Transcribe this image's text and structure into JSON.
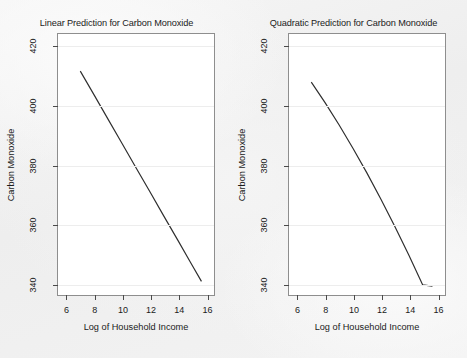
{
  "figure": {
    "background_color": "#f2f2f2",
    "plot_background_color": "#ffffff",
    "line_color": "#2e2e2e",
    "grid_color": "#ededed"
  },
  "chart_data": [
    {
      "type": "line",
      "panel": "left",
      "title": "Linear Prediction for Carbon Monoxide",
      "xlabel": "Log of Household Income",
      "ylabel": "Carbon Monoxide",
      "xlim": [
        5.4,
        16.6
      ],
      "ylim": [
        336,
        424
      ],
      "xticks": [
        6,
        8,
        10,
        12,
        14,
        16
      ],
      "yticks": [
        340,
        360,
        380,
        400,
        420
      ],
      "xtick_labels": [
        "6",
        "8",
        "10",
        "12",
        "14",
        "16"
      ],
      "ytick_labels": [
        "340",
        "360",
        "380",
        "400",
        "420"
      ],
      "grid": true,
      "legend": null,
      "series": [
        {
          "name": "Linear prediction",
          "x": [
            7.0,
            8.0,
            9.0,
            10.0,
            11.0,
            12.0,
            13.0,
            14.0,
            15.0,
            15.7
          ],
          "y": [
            411.5,
            403.4,
            395.2,
            387.1,
            378.9,
            370.8,
            362.6,
            354.5,
            346.3,
            340.6
          ]
        }
      ]
    },
    {
      "type": "line",
      "panel": "right",
      "title": "Quadratic Prediction for Carbon Monoxide",
      "xlabel": "Log of Household Income",
      "ylabel": "Carbon Monoxide",
      "xlim": [
        5.4,
        16.6
      ],
      "ylim": [
        336,
        424
      ],
      "xticks": [
        6,
        8,
        10,
        12,
        14,
        16
      ],
      "yticks": [
        340,
        360,
        380,
        400,
        420
      ],
      "xtick_labels": [
        "6",
        "8",
        "10",
        "12",
        "14",
        "16"
      ],
      "ytick_labels": [
        "340",
        "360",
        "380",
        "400",
        "420"
      ],
      "grid": true,
      "legend": null,
      "series": [
        {
          "name": "Quadratic prediction",
          "x": [
            7.0,
            8.0,
            9.0,
            10.0,
            11.0,
            12.0,
            13.0,
            14.0,
            15.0,
            15.7
          ],
          "y": [
            407.8,
            400.8,
            393.3,
            385.4,
            377.1,
            368.3,
            359.1,
            349.5,
            339.4,
            339.0
          ]
        }
      ]
    }
  ]
}
